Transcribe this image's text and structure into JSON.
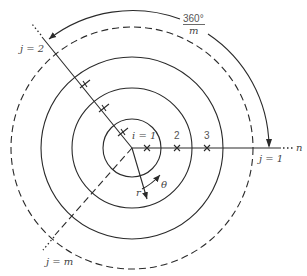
{
  "diagram": {
    "center": {
      "x": 132,
      "y": 148
    },
    "circles": [
      {
        "index": 1,
        "radius": 29,
        "style": "solid"
      },
      {
        "index": 2,
        "radius": 60,
        "style": "solid"
      },
      {
        "index": 3,
        "radius": 91,
        "style": "solid"
      },
      {
        "index": "n",
        "radius": 121,
        "style": "dashed"
      }
    ],
    "radial_lines": [
      {
        "label": "j = 1",
        "angle_deg": 0,
        "style": "solid"
      },
      {
        "label": "j = 2",
        "angle_deg": 129,
        "style": "solid"
      },
      {
        "label": "j = m",
        "angle_deg": 228,
        "style": "dashed"
      }
    ],
    "labels": {
      "angle_numerator": "360°",
      "angle_denominator": "m",
      "j1": "j = 1",
      "j2": "j = 2",
      "jm": "j = m",
      "i1": "i = 1",
      "i2": "2",
      "i3": "3",
      "n": "n",
      "r": "r",
      "theta": "θ",
      "ellipsis": "···"
    },
    "colors": {
      "stroke": "#2a2a2a",
      "text": "#444444"
    }
  }
}
